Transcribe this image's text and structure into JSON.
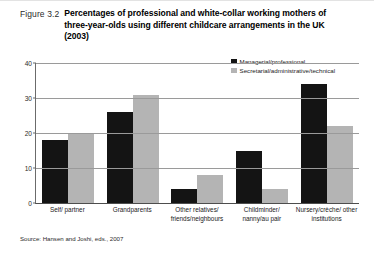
{
  "figure": {
    "number": "Figure 3.2",
    "title": "Percentages of professional and white-collar working mothers of three-year-olds using different childcare arrangements in the UK (2003)",
    "source": "Source: Hansen and Joshi, eds., 2007"
  },
  "colors": {
    "series_managerial": "#141414",
    "series_secretarial": "#b4b4b4",
    "gridline": "#9a9a9a",
    "axis": "#4d4d4d",
    "background": "#ffffff"
  },
  "chart_data": {
    "type": "bar",
    "title": "Percentages of professional and white-collar working mothers of three-year-olds using different childcare arrangements in the UK (2003)",
    "xlabel": "",
    "ylabel": "",
    "ylim": [
      0,
      40
    ],
    "yticks": [
      0,
      10,
      20,
      30,
      40
    ],
    "ytick_labels": [
      "0",
      "10",
      "20",
      "30",
      "40"
    ],
    "grid": true,
    "legend_position": "top-right",
    "categories": [
      "Self/ partner",
      "Grandparents",
      "Other relatives/ friends/neighbours",
      "Childminder/ nanny/au pair",
      "Nursery/crèche/ other institutions"
    ],
    "series": [
      {
        "name": "Managerial/professional",
        "color": "#141414",
        "values": [
          18,
          26,
          4,
          15,
          34
        ]
      },
      {
        "name": "Secretarial/administrative/technical",
        "color": "#b4b4b4",
        "values": [
          20,
          31,
          8,
          4,
          22
        ]
      }
    ]
  }
}
